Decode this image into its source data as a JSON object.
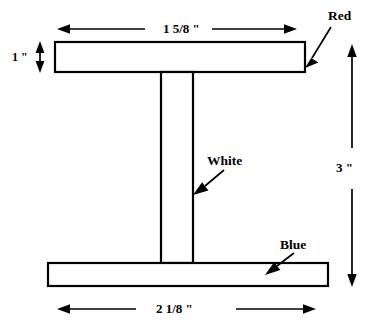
{
  "diagram": {
    "line_color": "#000000",
    "fill_color": "#ffffff",
    "background": "#ffffff",
    "dimensions": {
      "top_flange_width": "1 5/8 \"",
      "top_flange_height": "1 \"",
      "bottom_flange_width": "2 1/8 \"",
      "total_height": "3 \""
    },
    "part_labels": {
      "top_flange": "Red",
      "web": "White",
      "bottom_flange": "Blue"
    }
  }
}
